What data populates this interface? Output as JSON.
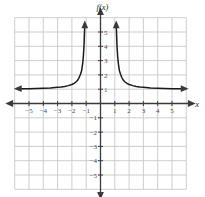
{
  "figure": {
    "function_label": "f(x)",
    "x_axis_label": "x",
    "background_color": "#ffffff",
    "grid_color": "#c8c8c8",
    "axis_color": "#3a3a3a",
    "curve_color": "#1a1a1a"
  },
  "chart_data": {
    "type": "line",
    "title": "",
    "subtitle": "",
    "xlabel": "x",
    "ylabel": "f(x)",
    "xlim": [
      -6,
      6
    ],
    "ylim": [
      -6,
      6
    ],
    "grid": true,
    "legend": null,
    "x_ticks": [
      -5,
      -4,
      -3,
      -2,
      -1,
      1,
      2,
      3,
      4,
      5
    ],
    "x_tick_labels": [
      "−5",
      "−4",
      "−3",
      "−2",
      "−1",
      "1",
      "2",
      "3",
      "4",
      "5"
    ],
    "y_ticks": [
      -5,
      -4,
      -3,
      -2,
      -1,
      1,
      2,
      3,
      4,
      5
    ],
    "y_tick_labels": [
      "−5",
      "−4",
      "−3",
      "−2",
      "−1",
      "1",
      "2",
      "3",
      "4",
      "5"
    ],
    "vertical_asymptotes": [
      -1,
      1
    ],
    "horizontal_asymptote": 1,
    "expression": "x^2/(x^2-1)",
    "series": [
      {
        "name": "left-branch",
        "arrow_start": "left",
        "arrow_end": "up",
        "points": [
          [
            -5.75,
            1.04
          ],
          [
            -5.5,
            1.04
          ],
          [
            -5.0,
            1.04
          ],
          [
            -4.5,
            1.05
          ],
          [
            -4.0,
            1.07
          ],
          [
            -3.5,
            1.09
          ],
          [
            -3.0,
            1.13
          ],
          [
            -2.75,
            1.15
          ],
          [
            -2.5,
            1.19
          ],
          [
            -2.25,
            1.25
          ],
          [
            -2.0,
            1.33
          ],
          [
            -1.85,
            1.41
          ],
          [
            -1.7,
            1.52
          ],
          [
            -1.6,
            1.62
          ],
          [
            -1.5,
            1.8
          ],
          [
            -1.4,
            2.04
          ],
          [
            -1.32,
            2.3
          ],
          [
            -1.25,
            2.78
          ],
          [
            -1.2,
            3.27
          ],
          [
            -1.15,
            4.12
          ],
          [
            -1.12,
            4.96
          ],
          [
            -1.1,
            5.5
          ]
        ]
      },
      {
        "name": "right-branch",
        "arrow_start": "up",
        "arrow_end": "right",
        "points": [
          [
            1.1,
            5.5
          ],
          [
            1.12,
            4.96
          ],
          [
            1.15,
            4.12
          ],
          [
            1.2,
            3.27
          ],
          [
            1.25,
            2.78
          ],
          [
            1.32,
            2.3
          ],
          [
            1.4,
            2.04
          ],
          [
            1.5,
            1.8
          ],
          [
            1.6,
            1.62
          ],
          [
            1.7,
            1.52
          ],
          [
            1.85,
            1.41
          ],
          [
            2.0,
            1.33
          ],
          [
            2.25,
            1.25
          ],
          [
            2.5,
            1.19
          ],
          [
            2.75,
            1.15
          ],
          [
            3.0,
            1.13
          ],
          [
            3.5,
            1.09
          ],
          [
            4.0,
            1.07
          ],
          [
            4.5,
            1.05
          ],
          [
            5.0,
            1.04
          ],
          [
            5.5,
            1.04
          ],
          [
            5.85,
            1.04
          ]
        ]
      }
    ]
  }
}
